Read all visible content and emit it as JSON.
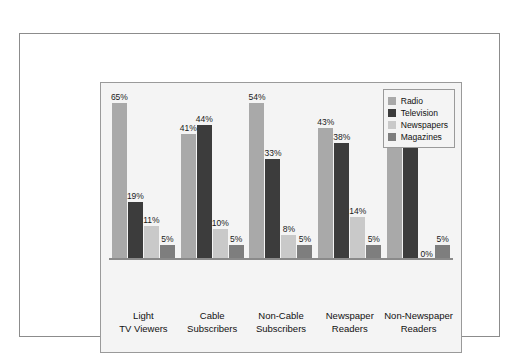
{
  "chart_data": {
    "type": "bar",
    "title": "",
    "subtitle": "",
    "xlabel": "",
    "ylabel": "",
    "ylim": [
      0,
      70
    ],
    "grid": false,
    "legend_position": "top-right",
    "value_format": "percent",
    "categories": [
      "Light\nTV Viewers",
      "Cable\nSubscribers",
      "Non-Cable\nSubscribers",
      "Newspaper\nReaders",
      "Non-Newspaper\nReaders"
    ],
    "category_lines": [
      [
        "Light",
        "TV Viewers"
      ],
      [
        "Cable",
        "Subscribers"
      ],
      [
        "Non-Cable",
        "Subscribers"
      ],
      [
        "Newspaper",
        "Readers"
      ],
      [
        "Non-Newspaper",
        "Readers"
      ]
    ],
    "series": [
      {
        "name": "Radio",
        "color": "#a9a9a9",
        "values": [
          65,
          41,
          54,
          43,
          47
        ],
        "labels": [
          "65%",
          "41%",
          "54%",
          "43%",
          "47%"
        ]
      },
      {
        "name": "Television",
        "color": "#3c3c3c",
        "values": [
          19,
          44,
          33,
          38,
          48
        ],
        "labels": [
          "19%",
          "44%",
          "33%",
          "38%",
          "48%"
        ]
      },
      {
        "name": "Newspapers",
        "color": "#c9c9c9",
        "values": [
          11,
          10,
          8,
          14,
          0
        ],
        "labels": [
          "11%",
          "10%",
          "8%",
          "14%",
          "0%"
        ]
      },
      {
        "name": "Magazines",
        "color": "#7e7e7e",
        "values": [
          5,
          5,
          5,
          5,
          5
        ],
        "labels": [
          "5%",
          "5%",
          "5%",
          "5%",
          "5%"
        ]
      }
    ]
  },
  "legend": {
    "items": [
      {
        "label": "Radio"
      },
      {
        "label": "Television"
      },
      {
        "label": "Newspapers"
      },
      {
        "label": "Magazines"
      }
    ]
  },
  "colors": {
    "radio": "#a9a9a9",
    "television": "#3c3c3c",
    "newspapers": "#c9c9c9",
    "magazines": "#7e7e7e",
    "panel_background": "#f4f4f4",
    "frame_border": "#8c8c8c",
    "axis_line": "#8a8a8a",
    "text": "#111111"
  }
}
